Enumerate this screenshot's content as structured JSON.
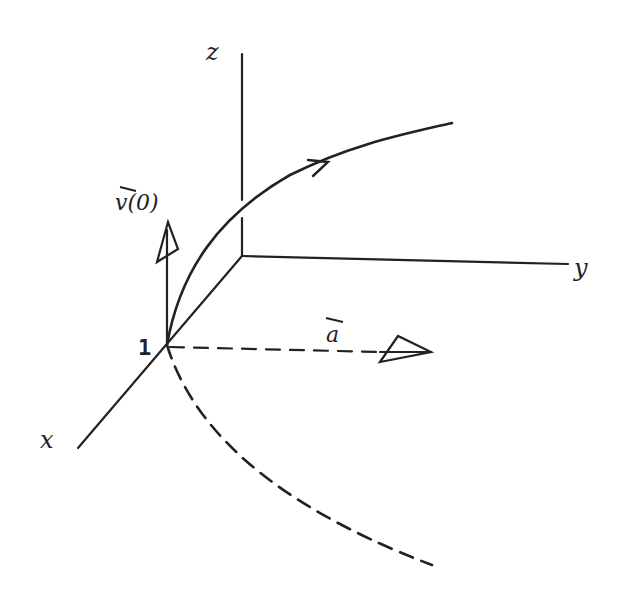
{
  "diagram": {
    "axes": {
      "z_label": "z",
      "y_label": "y",
      "x_label": "x"
    },
    "point_label": "1",
    "velocity_label": "v(0)",
    "acceleration_label": "a",
    "stroke_color": "#222222",
    "background": "#ffffff"
  }
}
